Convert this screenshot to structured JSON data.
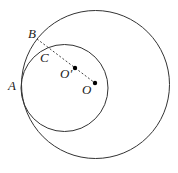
{
  "diagram": {
    "outer_circle": {
      "cx": 95.5,
      "cy": 84.5,
      "r": 74
    },
    "inner_circle": {
      "cx": 64.5,
      "cy": 88,
      "r": 43.5
    },
    "dashed_segment": {
      "x1": 37,
      "y1": 39,
      "x2": 95,
      "y2": 83
    },
    "points": [
      {
        "name": "A",
        "label": "A",
        "x": 21,
        "y": 86,
        "lx": 8,
        "ly": 90
      },
      {
        "name": "B",
        "label": "B",
        "x": 37,
        "y": 39,
        "lx": 28,
        "ly": 38
      },
      {
        "name": "C",
        "label": "C",
        "x": 47,
        "y": 46,
        "lx": 40,
        "ly": 62
      },
      {
        "name": "O-prime",
        "label": "O′",
        "x": 75,
        "y": 68,
        "lx": 60,
        "ly": 77
      },
      {
        "name": "O",
        "label": "O",
        "x": 95,
        "y": 83,
        "lx": 82,
        "ly": 94
      }
    ],
    "stroke_color": "#333333"
  }
}
